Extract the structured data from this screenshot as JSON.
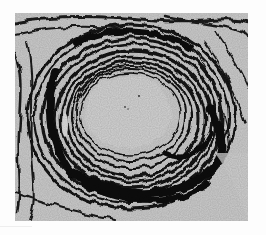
{
  "image": {
    "subject": "histology micrograph of vessel cross-section with concentric elastic fiber layers",
    "style": "grayscale",
    "colors": {
      "frame": "#fdfdfd",
      "background_tissue": "#cfcfcf",
      "lumen": "#d6d6d6",
      "fibers": "#111111",
      "fibers_mid": "#3a3a3a"
    },
    "photo_bounds": {
      "x": 15,
      "y": 13,
      "width": 233,
      "height": 208
    },
    "lumen": {
      "cx": 113,
      "cy": 99,
      "rx": 44,
      "ry": 36
    }
  }
}
